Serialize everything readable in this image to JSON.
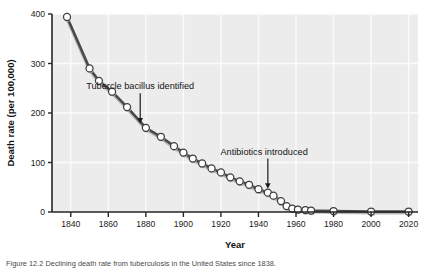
{
  "figure": {
    "caption": "Figure 12.2   Declining death rate from tuberculosis in the United States since 1838.",
    "background_color": "#ffffff",
    "plot_background_color": "#ececec",
    "gridline_color": "#fbfbfb",
    "marker_fill_color": "#ffffff",
    "marker_edge_color": "#3d3d3d",
    "line_color": "#4a4a4a"
  },
  "chart_data": {
    "type": "line",
    "title": "",
    "xlabel": "Year",
    "ylabel": "Death rate (per 100,000)",
    "xlim": [
      1830,
      2025
    ],
    "ylim": [
      0,
      400
    ],
    "xticks": [
      1840,
      1860,
      1880,
      1900,
      1920,
      1940,
      1960,
      1980,
      2000,
      2020
    ],
    "yticks": [
      0,
      100,
      200,
      300,
      400
    ],
    "grid": "horizontal-and-vertical-light",
    "legend": "none",
    "series": [
      {
        "name": "Tuberculosis death rate",
        "x": [
          1838,
          1850,
          1855,
          1862,
          1870,
          1880,
          1888,
          1895,
          1900,
          1905,
          1910,
          1915,
          1920,
          1925,
          1930,
          1935,
          1940,
          1945,
          1948,
          1952,
          1955,
          1958,
          1961,
          1965,
          1968,
          1980,
          2000,
          2020
        ],
        "values": [
          394,
          290,
          265,
          243,
          212,
          170,
          152,
          133,
          120,
          108,
          98,
          88,
          80,
          70,
          62,
          55,
          46,
          39,
          33,
          22,
          12,
          7,
          5,
          4,
          3,
          2,
          1,
          1
        ]
      }
    ],
    "annotations": [
      {
        "text": "Tubercle bacillus identified",
        "label_x": 1877,
        "label_y": 248,
        "arrow_target_x": 1877,
        "arrow_target_y": 178
      },
      {
        "text": "Antibiotics introduced",
        "label_x": 1943,
        "label_y": 116,
        "arrow_target_x": 1945,
        "arrow_target_y": 46
      }
    ]
  }
}
